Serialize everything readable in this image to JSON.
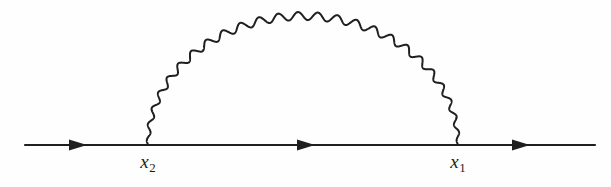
{
  "figure": {
    "kind": "feynman-diagram",
    "background_color": "#fefefe",
    "ink_color": "#1f1f1f"
  },
  "fermion_line": {
    "name": "fermion-propagator",
    "label": "",
    "x_start": 25,
    "x_end": 595,
    "y": 145,
    "stroke_width": 2.2,
    "arrows": [
      {
        "name": "arrowhead-left",
        "x": 78,
        "direction": "right"
      },
      {
        "name": "arrowhead-middle",
        "x": 306,
        "direction": "right"
      },
      {
        "name": "arrowhead-right",
        "x": 521,
        "direction": "right"
      }
    ],
    "arrow_half_length": 9,
    "arrow_half_height": 5.5
  },
  "photon_line": {
    "name": "photon-propagator",
    "shape": "semicircular-wavy-arc",
    "x_left_vertex": 148,
    "x_right_vertex": 458,
    "baseline_y": 145,
    "apex_y": 16,
    "oscillations": 25,
    "amplitude": 4.0,
    "stroke_width": 2.0
  },
  "labels": {
    "vertex_right": {
      "name": "label-x1",
      "base": "x",
      "sub": "1",
      "x": 458,
      "y": 152
    },
    "vertex_left": {
      "name": "label-x2",
      "base": "x",
      "sub": "2",
      "x": 148,
      "y": 152
    }
  }
}
